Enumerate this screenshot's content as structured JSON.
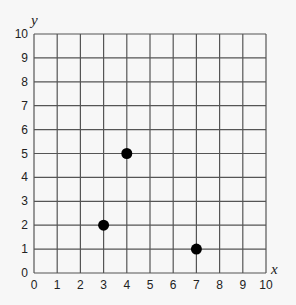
{
  "chart_data": {
    "type": "scatter",
    "title": "",
    "xlabel": "x",
    "ylabel": "y",
    "xlim": [
      0,
      10
    ],
    "ylim": [
      0,
      10
    ],
    "grid": true,
    "x_ticks": [
      0,
      1,
      2,
      3,
      4,
      5,
      6,
      7,
      8,
      9,
      10
    ],
    "y_ticks": [
      0,
      1,
      2,
      3,
      4,
      5,
      6,
      7,
      8,
      9,
      10
    ],
    "points": [
      {
        "x": 4,
        "y": 5
      },
      {
        "x": 3,
        "y": 2
      },
      {
        "x": 7,
        "y": 1
      }
    ],
    "colors": {
      "grid": "#555555",
      "point": "#000000",
      "background": "#f7f7f7"
    }
  }
}
